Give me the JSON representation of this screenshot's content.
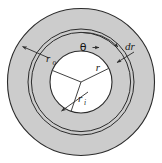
{
  "figure": {
    "background_color": "#ffffff",
    "stroke_color": "#2b2b2b",
    "annulus_fill": "#cccccc",
    "core_fill": "#ffffff",
    "labels": {
      "outer_radius": {
        "symbol": "r",
        "subscript": "o"
      },
      "inner_radius": {
        "symbol": "r",
        "subscript": "i"
      },
      "radius": {
        "symbol": "r",
        "subscript": ""
      },
      "thickness": {
        "symbol": "dr",
        "subscript": ""
      },
      "angle": {
        "symbol": "θ",
        "subscript": ""
      }
    },
    "geometry": {
      "center_x": 81,
      "center_y": 82,
      "outer_radius_px": 74,
      "ring_outer_px": 53,
      "ring_inner_px": 50,
      "inner_radius_px": 31
    }
  }
}
